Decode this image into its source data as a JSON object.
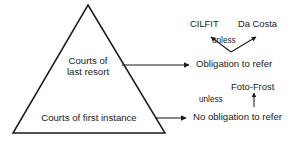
{
  "diagram": {
    "stroke_color": "#1a1a1a",
    "text_color": "#1a1a1a",
    "background_color": "#ffffff",
    "pyramid": {
      "top_tier": {
        "line1": "Courts of",
        "line2": "last resort"
      },
      "bottom_tier": {
        "label": "Courts of first instance"
      }
    },
    "branches": {
      "top": {
        "outcome": "Obligation to refer",
        "qualifier": "unless",
        "exceptions": [
          "CILFIT",
          "Da Costa"
        ]
      },
      "bottom": {
        "outcome": "No obligation to refer",
        "qualifier": "unless",
        "exceptions": [
          "Foto-Frost"
        ]
      }
    }
  }
}
